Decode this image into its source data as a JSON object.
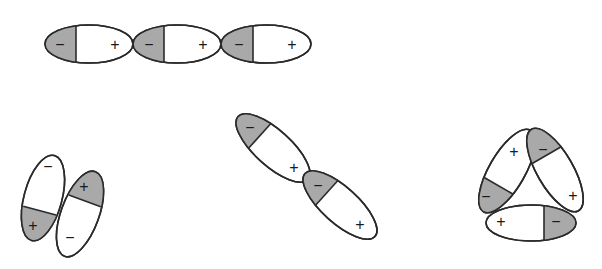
{
  "diagram": {
    "colors": {
      "negative_shade": "#a9a9a9",
      "outline": "#2a2a2a",
      "background": "#ffffff"
    },
    "labels": {
      "negative": "−",
      "positive": "+"
    },
    "groups": [
      {
        "name": "head-to-tail-chain",
        "dipoles": [
          {
            "cx": 89,
            "cy": 44,
            "rx": 44,
            "ry": 19,
            "angle": 0,
            "neg_end": "left"
          },
          {
            "cx": 177,
            "cy": 44,
            "rx": 44,
            "ry": 19,
            "angle": 0,
            "neg_end": "left"
          },
          {
            "cx": 266,
            "cy": 44,
            "rx": 45,
            "ry": 19,
            "angle": 0,
            "neg_end": "left"
          }
        ]
      },
      {
        "name": "antiparallel-pair",
        "dipoles": [
          {
            "cx": 43,
            "cy": 198,
            "rx": 44,
            "ry": 19,
            "angle": 105,
            "neg_end": "top"
          },
          {
            "cx": 80,
            "cy": 214,
            "rx": 45,
            "ry": 19,
            "angle": 110,
            "neg_end": "bottom"
          }
        ]
      },
      {
        "name": "diagonal-head-to-tail",
        "dipoles": [
          {
            "cx": 273,
            "cy": 148,
            "rx": 47,
            "ry": 18,
            "angle": 42,
            "neg_end": "upper-left"
          },
          {
            "cx": 340,
            "cy": 205,
            "rx": 47,
            "ry": 18,
            "angle": 42,
            "neg_end": "upper-left"
          }
        ]
      },
      {
        "name": "triangular-cycle",
        "dipoles": [
          {
            "cx": 507,
            "cy": 171,
            "rx": 47,
            "ry": 18,
            "angle": 120,
            "neg_end": "lower-left"
          },
          {
            "cx": 555,
            "cy": 170,
            "rx": 47,
            "ry": 18,
            "angle": 60,
            "neg_end": "upper-left"
          },
          {
            "cx": 531,
            "cy": 223,
            "rx": 45,
            "ry": 18,
            "angle": 0,
            "neg_end": "right"
          }
        ]
      }
    ]
  }
}
